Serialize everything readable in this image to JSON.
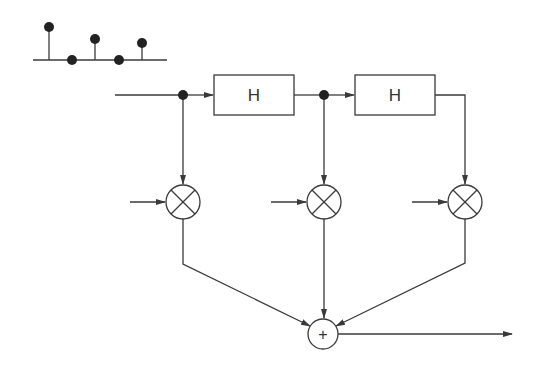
{
  "diagram": {
    "colors": {
      "stroke": "#3a3a3a",
      "dot": "#222222",
      "background": "#ffffff"
    },
    "stem_plot": {
      "baseline": {
        "x1": 33,
        "x2": 167,
        "y": 60
      },
      "stems": [
        {
          "x": 49,
          "top": 27
        },
        {
          "x": 72,
          "top": 60
        },
        {
          "x": 95,
          "top": 39
        },
        {
          "x": 119,
          "top": 60
        },
        {
          "x": 142,
          "top": 43
        }
      ]
    },
    "blocks": [
      {
        "id": "delay-1",
        "label": "H",
        "x": 214,
        "y": 75,
        "w": 80,
        "h": 40
      },
      {
        "id": "delay-2",
        "label": "H",
        "x": 355,
        "y": 75,
        "w": 80,
        "h": 40
      }
    ],
    "multipliers": [
      {
        "id": "mult-1",
        "cx": 183,
        "cy": 202,
        "r": 17
      },
      {
        "id": "mult-2",
        "cx": 324,
        "cy": 202,
        "r": 17
      },
      {
        "id": "mult-3",
        "cx": 465,
        "cy": 202,
        "r": 17
      }
    ],
    "adder": {
      "label": "+",
      "cx": 323,
      "cy": 334,
      "r": 15
    },
    "junctions": [
      {
        "cx": 183,
        "cy": 95
      },
      {
        "cx": 324,
        "cy": 95
      }
    ]
  }
}
